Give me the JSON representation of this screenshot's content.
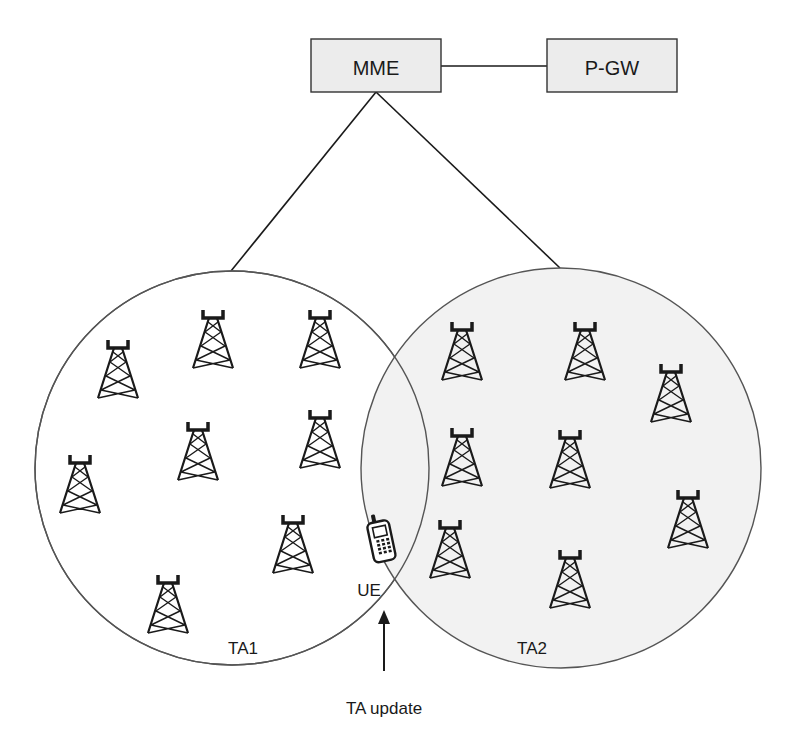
{
  "nodes": {
    "mme": {
      "label": "MME"
    },
    "pgw": {
      "label": "P-GW"
    }
  },
  "areas": {
    "ta1": {
      "label": "TA1"
    },
    "ta2": {
      "label": "TA2"
    }
  },
  "ue": {
    "label": "UE"
  },
  "annotation": {
    "label": "TA update"
  },
  "colors": {
    "box_fill": "#ececec",
    "ta2_fill": "#f2f2f2",
    "stroke": "#1a1a1a",
    "circle_stroke": "#555555"
  },
  "towers": {
    "ta1": [
      [
        118,
        340
      ],
      [
        213,
        310
      ],
      [
        320,
        310
      ],
      [
        80,
        455
      ],
      [
        198,
        420
      ],
      [
        320,
        410
      ],
      [
        293,
        515
      ],
      [
        168,
        575
      ]
    ],
    "ta2": [
      [
        462,
        322
      ],
      [
        585,
        322
      ],
      [
        671,
        362
      ],
      [
        462,
        428
      ],
      [
        570,
        430
      ],
      [
        688,
        490
      ],
      [
        450,
        520
      ],
      [
        570,
        550
      ]
    ]
  }
}
